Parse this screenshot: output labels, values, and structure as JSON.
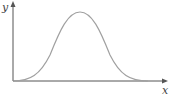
{
  "diagram": {
    "type": "function-curve",
    "axes": {
      "x_label": "x",
      "y_label": "y"
    },
    "curve": {
      "shape": "bell",
      "description": "Smooth single-hump curve starting at origin, rising to a peak near the middle, returning to zero"
    },
    "colors": {
      "axis": "#555555",
      "curve": "#a0a0a0",
      "label": "#444444"
    }
  }
}
